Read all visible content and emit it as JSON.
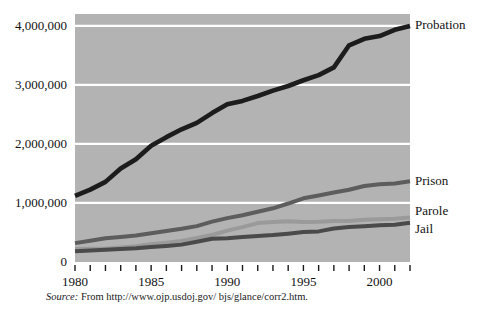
{
  "chart_data": {
    "type": "line",
    "title": "",
    "subtitle": "",
    "xlabel": "",
    "ylabel": "",
    "xlim": [
      1980,
      2002
    ],
    "ylim": [
      0,
      4200000
    ],
    "grid": true,
    "gridlines_y": [
      1000000,
      2000000,
      3000000,
      4000000
    ],
    "legend_position": "right-inline",
    "x": [
      1980,
      1981,
      1982,
      1983,
      1984,
      1985,
      1986,
      1987,
      1988,
      1989,
      1990,
      1991,
      1992,
      1993,
      1994,
      1995,
      1996,
      1997,
      1998,
      1999,
      2000,
      2001,
      2002
    ],
    "series": [
      {
        "name": "Probation",
        "color": "#1c1c1c",
        "values": [
          1118097,
          1225934,
          1357264,
          1582947,
          1740948,
          1968712,
          2114621,
          2247158,
          2356483,
          2522125,
          2670234,
          2728472,
          2811611,
          2903061,
          2981022,
          3077861,
          3164996,
          3296513,
          3670441,
          3779922,
          3826209,
          3931731,
          3995165
        ]
      },
      {
        "name": "Prison",
        "color": "#5d5d5d",
        "values": [
          319598,
          360029,
          402914,
          423898,
          448264,
          487593,
          526436,
          562814,
          607766,
          683367,
          743382,
          792535,
          850566,
          909381,
          990147,
          1078542,
          1127528,
          1176564,
          1224469,
          1287172,
          1316333,
          1330007,
          1367856
        ]
      },
      {
        "name": "Parole",
        "color": "#9a9a9a",
        "values": [
          220438,
          225539,
          224604,
          246440,
          266992,
          300203,
          325638,
          355505,
          407977,
          456803,
          531407,
          590442,
          658601,
          676100,
          690371,
          679421,
          679733,
          694787,
          696385,
          714457,
          723898,
          732333,
          753141
        ]
      },
      {
        "name": "Jail",
        "color": "#4a4a4a",
        "values": [
          182288,
          195085,
          207853,
          221815,
          233018,
          254986,
          272736,
          294092,
          341893,
          393303,
          403019,
          424129,
          441781,
          455500,
          479800,
          507044,
          518492,
          567079,
          592462,
          605943,
          621149,
          631240,
          665475
        ]
      }
    ]
  },
  "axes": {
    "y_ticks": [
      {
        "value": 0,
        "label": "0"
      },
      {
        "value": 1000000,
        "label": "1,000,000"
      },
      {
        "value": 2000000,
        "label": "2,000,000"
      },
      {
        "value": 3000000,
        "label": "3,000,000"
      },
      {
        "value": 4000000,
        "label": "4,000,000"
      }
    ],
    "x_ticks": [
      {
        "value": 1980,
        "label": "1980"
      },
      {
        "value": 1985,
        "label": "1985"
      },
      {
        "value": 1990,
        "label": "1990"
      },
      {
        "value": 1995,
        "label": "1995"
      },
      {
        "value": 2000,
        "label": "2000"
      }
    ],
    "x_minor_count": 23
  },
  "legend": {
    "items": [
      {
        "label": "Probation"
      },
      {
        "label": "Prison"
      },
      {
        "label": "Parole"
      },
      {
        "label": "Jail"
      }
    ]
  },
  "source": {
    "prefix": "Source:",
    "text": " From http://www.ojp.usdoj.gov/ bjs/glance/corr2.htm."
  },
  "colors": {
    "plot_background": "#b3b3b3",
    "gridline": "#ffffff",
    "page_background": "#ffffff",
    "text": "#111111"
  }
}
